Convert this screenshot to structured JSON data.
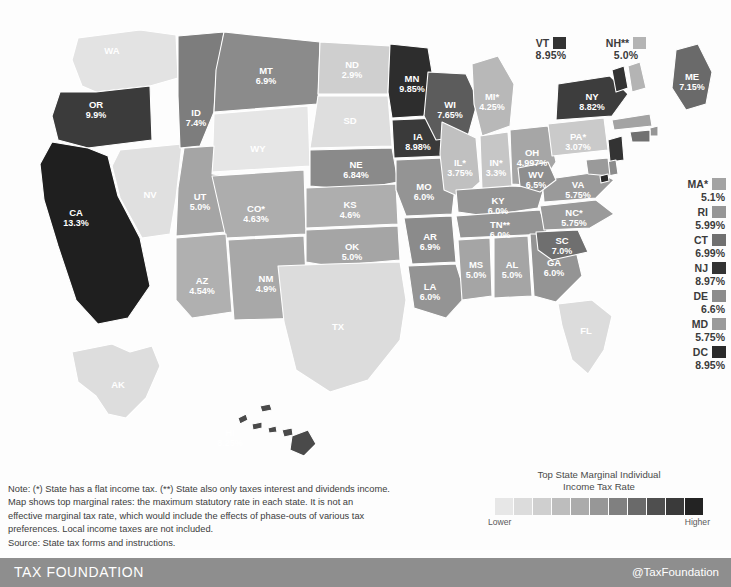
{
  "chart_data": {
    "type": "map",
    "title": "Top State Marginal Individual Income Tax Rate",
    "legend": {
      "title_line1": "Top State Marginal Individual",
      "title_line2": "Income Tax Rate",
      "low_label": "Lower",
      "high_label": "Higher",
      "swatches": [
        "#e7e7e7",
        "#dcdcdc",
        "#cfcfcf",
        "#bdbdbd",
        "#ababab",
        "#979797",
        "#808080",
        "#6a6a6a",
        "#4f4f4f",
        "#3a3a3a",
        "#232323"
      ]
    },
    "states": [
      {
        "code": "WA",
        "label": "WA",
        "pct": "",
        "rate": 0.0,
        "fill": "#e3e3e3",
        "flat": false,
        "interest_only": false
      },
      {
        "code": "OR",
        "label": "OR",
        "pct": "9.9%",
        "rate": 9.9,
        "fill": "#3b3b3b",
        "flat": false,
        "interest_only": false
      },
      {
        "code": "CA",
        "label": "CA",
        "pct": "13.3%",
        "rate": 13.3,
        "fill": "#1f1f1f",
        "flat": false,
        "interest_only": false
      },
      {
        "code": "ID",
        "label": "ID",
        "pct": "7.4%",
        "rate": 7.4,
        "fill": "#7d7d7d",
        "flat": false,
        "interest_only": false
      },
      {
        "code": "NV",
        "label": "NV",
        "pct": "",
        "rate": 0.0,
        "fill": "#e0e0e0",
        "flat": false,
        "interest_only": false
      },
      {
        "code": "MT",
        "label": "MT",
        "pct": "6.9%",
        "rate": 6.9,
        "fill": "#8b8b8b",
        "flat": false,
        "interest_only": false
      },
      {
        "code": "WY",
        "label": "WY",
        "pct": "",
        "rate": 0.0,
        "fill": "#e6e6e6",
        "flat": false,
        "interest_only": false
      },
      {
        "code": "UT",
        "label": "UT",
        "pct": "5.0%",
        "rate": 5.0,
        "fill": "#a5a5a5",
        "flat": true,
        "interest_only": false
      },
      {
        "code": "AZ",
        "label": "AZ",
        "pct": "4.54%",
        "rate": 4.54,
        "fill": "#b0b0b0",
        "flat": false,
        "interest_only": false
      },
      {
        "code": "CO",
        "label": "CO*",
        "pct": "4.63%",
        "rate": 4.63,
        "fill": "#adadad",
        "flat": true,
        "interest_only": false
      },
      {
        "code": "NM",
        "label": "NM",
        "pct": "4.9%",
        "rate": 4.9,
        "fill": "#a8a8a8",
        "flat": false,
        "interest_only": false
      },
      {
        "code": "ND",
        "label": "ND",
        "pct": "2.9%",
        "rate": 2.9,
        "fill": "#cfcfcf",
        "flat": false,
        "interest_only": false
      },
      {
        "code": "SD",
        "label": "SD",
        "pct": "",
        "rate": 0.0,
        "fill": "#dedede",
        "flat": false,
        "interest_only": false
      },
      {
        "code": "NE",
        "label": "NE",
        "pct": "6.84%",
        "rate": 6.84,
        "fill": "#8a8a8a",
        "flat": false,
        "interest_only": false
      },
      {
        "code": "KS",
        "label": "KS",
        "pct": "4.6%",
        "rate": 4.6,
        "fill": "#aeaeae",
        "flat": false,
        "interest_only": false
      },
      {
        "code": "OK",
        "label": "OK",
        "pct": "5.0%",
        "rate": 5.0,
        "fill": "#a5a5a5",
        "flat": false,
        "interest_only": false
      },
      {
        "code": "TX",
        "label": "TX",
        "pct": "",
        "rate": 0.0,
        "fill": "#dcdcdc",
        "flat": false,
        "interest_only": false
      },
      {
        "code": "MN",
        "label": "MN",
        "pct": "9.85%",
        "rate": 9.85,
        "fill": "#2d2d2d",
        "flat": false,
        "interest_only": false
      },
      {
        "code": "IA",
        "label": "IA",
        "pct": "8.98%",
        "rate": 8.98,
        "fill": "#3a3a3a",
        "flat": false,
        "interest_only": false
      },
      {
        "code": "MO",
        "label": "MO",
        "pct": "6.0%",
        "rate": 6.0,
        "fill": "#949494",
        "flat": false,
        "interest_only": false
      },
      {
        "code": "AR",
        "label": "AR",
        "pct": "6.9%",
        "rate": 6.9,
        "fill": "#8b8b8b",
        "flat": false,
        "interest_only": false
      },
      {
        "code": "LA",
        "label": "LA",
        "pct": "6.0%",
        "rate": 6.0,
        "fill": "#949494",
        "flat": false,
        "interest_only": false
      },
      {
        "code": "WI",
        "label": "WI",
        "pct": "7.65%",
        "rate": 7.65,
        "fill": "#5c5c5c",
        "flat": false,
        "interest_only": false
      },
      {
        "code": "IL",
        "label": "IL*",
        "pct": "3.75%",
        "rate": 3.75,
        "fill": "#c0c0c0",
        "flat": true,
        "interest_only": false
      },
      {
        "code": "MI",
        "label": "MI*",
        "pct": "4.25%",
        "rate": 4.25,
        "fill": "#b8b8b8",
        "flat": true,
        "interest_only": false
      },
      {
        "code": "IN",
        "label": "IN*",
        "pct": "3.3%",
        "rate": 3.3,
        "fill": "#c6c6c6",
        "flat": true,
        "interest_only": false
      },
      {
        "code": "OH",
        "label": "OH",
        "pct": "4.997%",
        "rate": 4.997,
        "fill": "#a6a6a6",
        "flat": false,
        "interest_only": false
      },
      {
        "code": "KY",
        "label": "KY",
        "pct": "6.0%",
        "rate": 6.0,
        "fill": "#949494",
        "flat": false,
        "interest_only": false
      },
      {
        "code": "TN",
        "label": "TN**",
        "pct": "6.0%",
        "rate": 6.0,
        "fill": "#949494",
        "flat": false,
        "interest_only": true
      },
      {
        "code": "MS",
        "label": "MS",
        "pct": "5.0%",
        "rate": 5.0,
        "fill": "#a5a5a5",
        "flat": false,
        "interest_only": false
      },
      {
        "code": "AL",
        "label": "AL",
        "pct": "5.0%",
        "rate": 5.0,
        "fill": "#a5a5a5",
        "flat": false,
        "interest_only": false
      },
      {
        "code": "GA",
        "label": "GA",
        "pct": "6.0%",
        "rate": 6.0,
        "fill": "#949494",
        "flat": false,
        "interest_only": false
      },
      {
        "code": "FL",
        "label": "FL",
        "pct": "",
        "rate": 0.0,
        "fill": "#dcdcdc",
        "flat": false,
        "interest_only": false
      },
      {
        "code": "SC",
        "label": "SC",
        "pct": "7.0%",
        "rate": 7.0,
        "fill": "#6f6f6f",
        "flat": false,
        "interest_only": false
      },
      {
        "code": "NC",
        "label": "NC*",
        "pct": "5.75%",
        "rate": 5.75,
        "fill": "#9a9a9a",
        "flat": true,
        "interest_only": false
      },
      {
        "code": "VA",
        "label": "VA",
        "pct": "5.75%",
        "rate": 5.75,
        "fill": "#9a9a9a",
        "flat": false,
        "interest_only": false
      },
      {
        "code": "WV",
        "label": "WV",
        "pct": "6.5%",
        "rate": 6.5,
        "fill": "#8e8e8e",
        "flat": false,
        "interest_only": false
      },
      {
        "code": "PA",
        "label": "PA*",
        "pct": "3.07%",
        "rate": 3.07,
        "fill": "#cacaca",
        "flat": true,
        "interest_only": false
      },
      {
        "code": "NY",
        "label": "NY",
        "pct": "8.82%",
        "rate": 8.82,
        "fill": "#3d3d3d",
        "flat": false,
        "interest_only": false
      },
      {
        "code": "ME",
        "label": "ME",
        "pct": "7.15%",
        "rate": 7.15,
        "fill": "#6a6a6a",
        "flat": false,
        "interest_only": false
      },
      {
        "code": "AK",
        "label": "AK",
        "pct": "",
        "rate": 0.0,
        "fill": "#dddddd",
        "flat": false,
        "interest_only": false
      },
      {
        "code": "HI",
        "label": "HI",
        "pct": "8.25%",
        "rate": 8.25,
        "fill": "#4a4a4a",
        "flat": false,
        "interest_only": false
      }
    ],
    "callouts_top": [
      {
        "code": "VT",
        "label": "VT",
        "pct": "8.95%",
        "rate": 8.95,
        "fill": "#333333"
      },
      {
        "code": "NH",
        "label": "NH**",
        "pct": "5.0%",
        "rate": 5.0,
        "fill": "#b4b4b4"
      }
    ],
    "callouts_right": [
      {
        "code": "MA",
        "label": "MA*",
        "pct": "5.1%",
        "rate": 5.1,
        "fill": "#a3a3a3"
      },
      {
        "code": "RI",
        "label": "RI",
        "pct": "5.99%",
        "rate": 5.99,
        "fill": "#969696"
      },
      {
        "code": "CT",
        "label": "CT",
        "pct": "6.99%",
        "rate": 6.99,
        "fill": "#707070"
      },
      {
        "code": "NJ",
        "label": "NJ",
        "pct": "8.97%",
        "rate": 8.97,
        "fill": "#333333"
      },
      {
        "code": "DE",
        "label": "DE",
        "pct": "6.6%",
        "rate": 6.6,
        "fill": "#8c8c8c"
      },
      {
        "code": "MD",
        "label": "MD",
        "pct": "5.75%",
        "rate": 5.75,
        "fill": "#9a9a9a"
      },
      {
        "code": "DC",
        "label": "DC",
        "pct": "8.95%",
        "rate": 8.95,
        "fill": "#2a2a2a"
      }
    ]
  },
  "note": {
    "line1": "Note: (*) State has a flat income tax. (**) State also only taxes interest and dividends income.",
    "line2": "Map shows top marginal rates: the maximum statutory rate in each state. It is not an",
    "line3": "effective marginal tax rate, which would include the effects of phase-outs of various tax",
    "line4": "preferences. Local income taxes are not included.",
    "line5": "Source: State tax forms and instructions."
  },
  "footer": {
    "brand": "TAX FOUNDATION",
    "handle": "@TaxFoundation"
  }
}
